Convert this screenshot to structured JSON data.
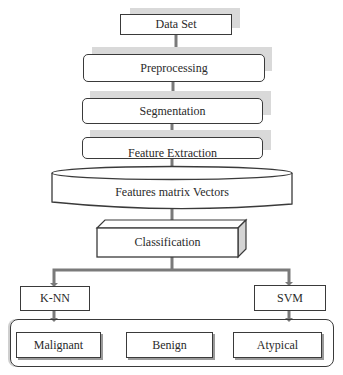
{
  "diagram": {
    "type": "flowchart",
    "nodes": {
      "data_set": "Data Set",
      "preprocessing": "Preprocessing",
      "segmentation": "Segmentation",
      "feature_extraction": "Feature Extraction",
      "features_matrix": "Features matrix Vectors",
      "classification": "Classification",
      "knn": "K-NN",
      "svm": "SVM",
      "malignant": "Malignant",
      "benign": "Benign",
      "atypical": "Atypical"
    },
    "edges": [
      [
        "Data Set",
        "Preprocessing"
      ],
      [
        "Preprocessing",
        "Segmentation"
      ],
      [
        "Segmentation",
        "Feature Extraction"
      ],
      [
        "Feature Extraction",
        "Features matrix Vectors"
      ],
      [
        "Features matrix Vectors",
        "Classification"
      ],
      [
        "Classification",
        "K-NN"
      ],
      [
        "Classification",
        "SVM"
      ],
      [
        "K-NN",
        "Output Classes"
      ],
      [
        "SVM",
        "Output Classes"
      ]
    ],
    "output_group": [
      "Malignant",
      "Benign",
      "Atypical"
    ],
    "colors": {
      "stroke": "#3a3a3a",
      "shadow": "#d9d9d9",
      "connector": "#7a7a7a"
    }
  }
}
